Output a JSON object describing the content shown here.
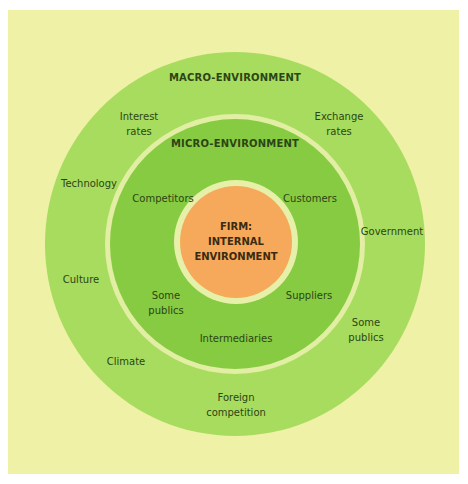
{
  "diagram": {
    "type": "concentric-circles",
    "colors": {
      "panel_background": "#EEF1A6",
      "macro_fill": "#A8DC5E",
      "micro_fill": "#87CB42",
      "ring": "#E2EEA3",
      "core_fill": "#F7A95B",
      "text": "#2C4514"
    },
    "macro": {
      "title": "MACRO-ENVIRONMENT",
      "factors": [
        {
          "line1": "Interest",
          "line2": "rates"
        },
        {
          "line1": "Exchange",
          "line2": "rates"
        },
        {
          "line1": "Technology",
          "line2": ""
        },
        {
          "line1": "Government",
          "line2": ""
        },
        {
          "line1": "Culture",
          "line2": ""
        },
        {
          "line1": "Some",
          "line2": "publics"
        },
        {
          "line1": "Climate",
          "line2": ""
        },
        {
          "line1": "Foreign",
          "line2": "competition"
        }
      ]
    },
    "micro": {
      "title": "MICRO-ENVIRONMENT",
      "factors": [
        {
          "line1": "Competitors",
          "line2": ""
        },
        {
          "line1": "Customers",
          "line2": ""
        },
        {
          "line1": "Some",
          "line2": "publics"
        },
        {
          "line1": "Suppliers",
          "line2": ""
        },
        {
          "line1": "Intermediaries",
          "line2": ""
        }
      ]
    },
    "core": {
      "line1": "FIRM:",
      "line2": "INTERNAL",
      "line3": "ENVIRONMENT"
    }
  }
}
